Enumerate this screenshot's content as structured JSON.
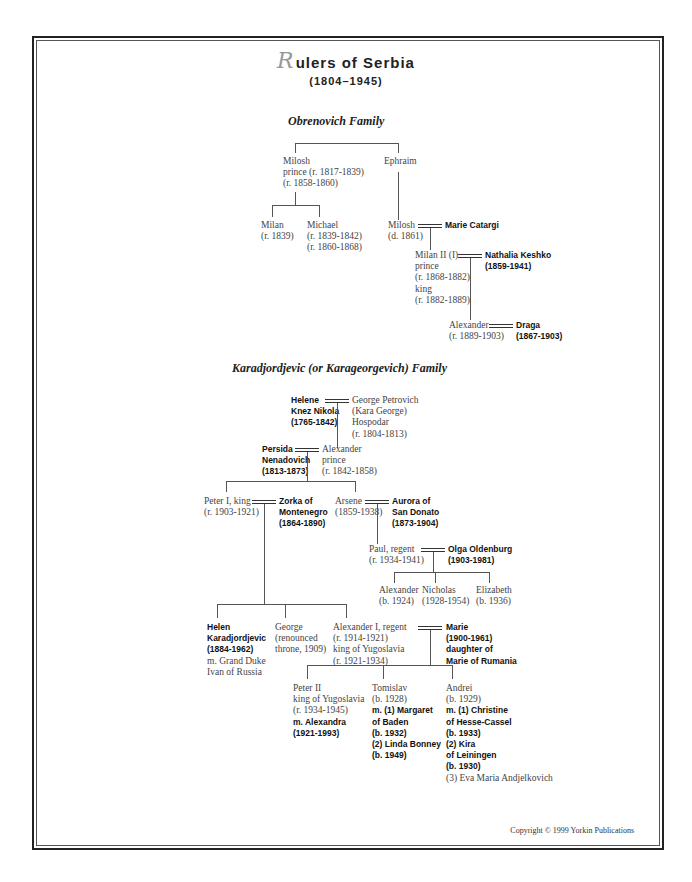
{
  "title": {
    "initial": "R",
    "rest": "ulers of Serbia",
    "years": "(1804–1945)"
  },
  "families": {
    "obrenovich": {
      "label": "Obrenovich Family",
      "milosh": "Milosh\nprince (r. 1817-1839)\n(r. 1858-1860)",
      "ephraim": "Ephraim",
      "milan": "Milan\n(r. 1839)",
      "michael": "Michael\n(r. 1839-1842)\n(r. 1860-1868)",
      "milosh2": "Milosh\n(d. 1861)",
      "marie_catargi": "Marie Catargi",
      "milan2": "Milan II (I)\nprince\n(r. 1868-1882)\nking\n(r. 1882-1889)",
      "nathalia": "Nathalia Keshko\n(1859-1941)",
      "alexander": "Alexander\n(r. 1889-1903)",
      "draga": "Draga\n(1867-1903)"
    },
    "karadjordjevic": {
      "label": "Karadjordjevic (or Karageorgevich) Family",
      "helene": "Helene\nKnez Nikola\n(1765-1842)",
      "george_petrovich": "George Petrovich\n(Kara George)\nHospodar\n(r. 1804-1813)",
      "persida": "Persida\nNenadovich\n(1813-1873)",
      "alexander": "Alexander\nprince\n(r. 1842-1858)",
      "peter1": "Peter I, king\n(r. 1903-1921)",
      "zorka": "Zorka of\nMontenegro\n(1864-1890)",
      "arsene": "Arsene\n(1859-1938)",
      "aurora": "Aurora of\nSan Donato\n(1873-1904)",
      "paul": "Paul, regent\n(r. 1934-1941)",
      "olga": "Olga Oldenburg\n(1903-1981)",
      "alexander_b": "Alexander\n(b. 1924)",
      "nicholas": "Nicholas\n(1928-1954)",
      "elizabeth": "Elizabeth\n(b. 1936)",
      "helen_bold": "Helen\nKaradjordjevic\n(1884-1962)",
      "helen_plain": "m. Grand Duke\nIvan of Russia",
      "george": "George\n(renounced\nthrone, 1909)",
      "alexander1": "Alexander I, regent\n(r. 1914-1921)\nking of Yugoslavia\n(r. 1921-1934)",
      "marie": "Marie\n(1900-1961)\ndaughter of\nMarie of Rumania",
      "peter2_plain": "Peter II\nking of Yugoslavia\n(r. 1934-1945)",
      "peter2_bold": "m. Alexandra\n(1921-1993)",
      "tomislav_plain": "Tomislav\n(b. 1928)",
      "tomislav_bold": "m. (1) Margaret\nof Baden\n(b. 1932)\n(2) Linda Bonney\n(b. 1949)",
      "andrei_plain": "Andrei\n(b. 1929)",
      "andrei_bold": "m. (1) Christine\nof Hesse-Cassel\n(b. 1933)\n(2) Kira\nof Leiningen\n(b. 1930)",
      "andrei_plain2": "(3) Eva Maria Andjelkovich"
    }
  },
  "copyright": "Copyright © 1999 Yorkin Publications"
}
